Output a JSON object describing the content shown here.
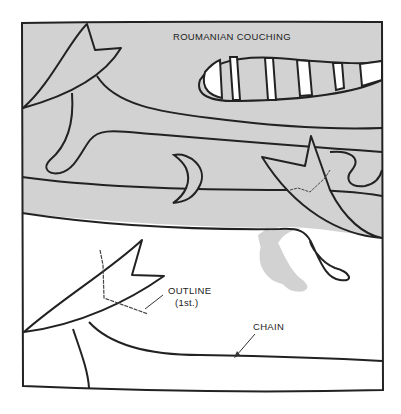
{
  "diagram": {
    "title": "ROUMANIAN COUCHING",
    "labels": {
      "outline": "OUTLINE",
      "outline_sub": "(1st.)",
      "chain": "CHAIN"
    },
    "colors": {
      "fill_gray": "#d2d2d2",
      "line": "#222222",
      "background": "#ffffff"
    }
  }
}
